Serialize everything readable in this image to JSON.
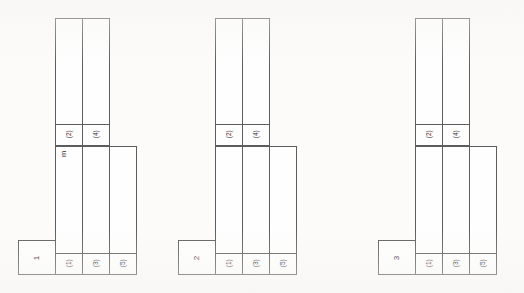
{
  "document": {
    "title": "Modular Layout Diagram",
    "background_color": "#fcfbfa",
    "line_color": "#5d5d5d",
    "text_color": "#2a2a2a"
  },
  "groups": [
    {
      "id": "group-1",
      "index_label": "1",
      "annotation": "m",
      "has_annotation": true,
      "upper_cells": [
        {
          "label": "(2)"
        },
        {
          "label": "(4)"
        }
      ],
      "lower_cells": [
        {
          "label": "(1)"
        },
        {
          "label": "(3)"
        },
        {
          "label": "(5)"
        }
      ]
    },
    {
      "id": "group-2",
      "index_label": "2",
      "annotation": "",
      "has_annotation": false,
      "upper_cells": [
        {
          "label": "(2)"
        },
        {
          "label": "(4)"
        }
      ],
      "lower_cells": [
        {
          "label": "(1)"
        },
        {
          "label": "(3)"
        },
        {
          "label": "(5)"
        }
      ]
    },
    {
      "id": "group-3",
      "index_label": "3",
      "annotation": "",
      "has_annotation": false,
      "upper_cells": [
        {
          "label": "(2)"
        },
        {
          "label": "(4)"
        }
      ],
      "lower_cells": [
        {
          "label": "(1)"
        },
        {
          "label": "(3)"
        },
        {
          "label": "(5)"
        }
      ]
    }
  ]
}
